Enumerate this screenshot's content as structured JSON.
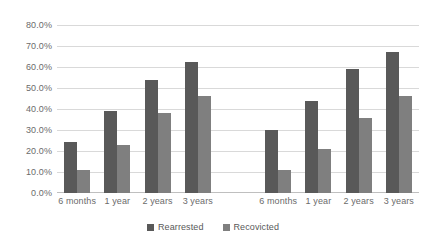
{
  "chart_data": {
    "type": "bar",
    "title": "",
    "subtitle": "",
    "xlabel": "",
    "ylabel": "",
    "ylim": [
      0,
      80
    ],
    "ytick_values": [
      0,
      10,
      20,
      30,
      40,
      50,
      60,
      70,
      80
    ],
    "ytick_labels": [
      "0.0%",
      "10.0%",
      "20.0%",
      "30.0%",
      "40.0%",
      "50.0%",
      "60.0%",
      "70.0%",
      "80.0%"
    ],
    "grid": "horizontal",
    "legend_position": "bottom-center",
    "categories": [
      "6 months",
      "1 year",
      "2 years",
      "3 years",
      "",
      "6 months",
      "1 year",
      "2 years",
      "3 years"
    ],
    "series": [
      {
        "name": "Rearrested",
        "color": "#595959",
        "values": [
          24.5,
          39.0,
          54.0,
          62.5,
          null,
          30.0,
          44.0,
          59.0,
          67.0
        ]
      },
      {
        "name": "Recovicted",
        "color": "#7f7f7f",
        "values": [
          11.0,
          23.0,
          38.0,
          46.0,
          null,
          11.0,
          21.0,
          35.5,
          46.0
        ]
      }
    ],
    "annotations": []
  },
  "legend": {
    "entries": [
      {
        "label": "Rearrested"
      },
      {
        "label": "Recovicted"
      }
    ]
  },
  "colors": {
    "series_rearrested": "#595959",
    "series_recovicted": "#7f7f7f",
    "gridline": "#d9d9d9",
    "axis_text": "#6b6b6b",
    "background": "#ffffff"
  }
}
